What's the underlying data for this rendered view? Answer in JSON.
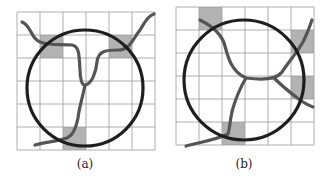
{
  "figure": {
    "panels": [
      {
        "id": "a",
        "caption": "(a)",
        "grid": {
          "x": 17,
          "y": 12,
          "cell": 23,
          "cols": 6,
          "rows": 6
        },
        "shaded_cells": [
          [
            1,
            1
          ],
          [
            4,
            1
          ],
          [
            2,
            5
          ]
        ],
        "circle": {
          "cx": 85,
          "cy": 88,
          "r": 58
        },
        "curves": [
          "M22,22 C32,26 30,38 40,42 C52,46 60,44 72,45 C80,46 79,58 80,70 C80,78 82,86 85,85 C92,84 96,72 97,62 C98,50 108,50 118,50 C130,50 132,40 140,30 C145,22 148,16 154,14",
          "M85,85 C82,100 79,108 78,118 C76,128 72,136 67,138 C55,142 45,142 35,145"
        ],
        "colors": {
          "grid": "#9a9a9a",
          "shade": "#b3b3b3",
          "circle": "#1e1e1e",
          "curve": "#555555"
        }
      },
      {
        "id": "b",
        "caption": "(b)",
        "grid": {
          "x": 176,
          "y": 7,
          "cell": 23,
          "cols": 6,
          "rows": 6
        },
        "shaded_cells": [
          [
            1,
            0
          ],
          [
            5,
            1
          ],
          [
            5,
            3
          ],
          [
            2,
            5
          ]
        ],
        "circle": {
          "cx": 244,
          "cy": 80,
          "r": 60
        },
        "curves": [
          "M200,20 C212,26 222,34 225,46 C228,58 232,72 246,78 C262,80 276,80 282,72 C290,60 296,54 303,42 C308,32 310,26 312,20",
          "M246,78 C240,88 236,98 233,108 C230,118 230,128 228,134 C216,140 200,142 186,146",
          "M274,78 C282,86 292,94 300,100 C306,104 310,106 313,107"
        ],
        "colors": {
          "grid": "#9a9a9a",
          "shade": "#b3b3b3",
          "circle": "#1e1e1e",
          "curve": "#555555"
        }
      }
    ]
  }
}
